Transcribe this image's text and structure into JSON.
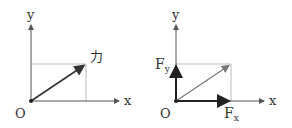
{
  "diagrams": [
    {
      "id": "left",
      "axis_x_label": "x",
      "axis_y_label": "y",
      "origin_label": "O",
      "vector_label": "力",
      "description": "Force vector from origin with dashed projection box"
    },
    {
      "id": "right",
      "axis_x_label": "x",
      "axis_y_label": "y",
      "origin_label": "O",
      "component_x_label": "F",
      "component_x_sub": "x",
      "component_y_label": "F",
      "component_y_sub": "y",
      "description": "Force decomposed into Fx and Fy components"
    }
  ],
  "colors": {
    "axis": "#555555",
    "vector": "#333333",
    "resultant_light": "#777777",
    "dashed": "#aaaaaa",
    "component": "#222222"
  }
}
